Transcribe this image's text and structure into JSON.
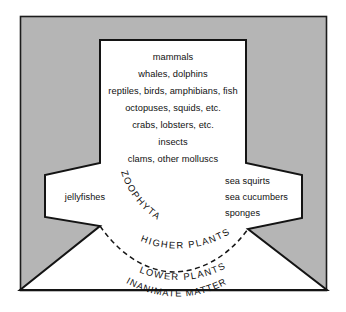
{
  "diagram": {
    "colors": {
      "background_gray": "#b5b5b5",
      "shape_fill": "#ffffff",
      "outline": "#141414",
      "text": "#111111"
    },
    "center_column": {
      "name": "animal-kingdom-list",
      "lines": [
        "mammals",
        "whales, dolphins",
        "reptiles, birds, amphibians, fish",
        "octopuses, squids, etc.",
        "crabs, lobsters, etc.",
        "insects",
        "clams, other molluscs"
      ]
    },
    "left_wing": {
      "name": "left-wing-group",
      "lines": [
        "jellyfishes"
      ]
    },
    "right_wing": {
      "name": "right-wing-group",
      "lines": [
        "sea squirts",
        "sea cucumbers",
        "sponges"
      ]
    },
    "arc_labels": [
      {
        "id": "zoophyta",
        "text": "ZOOPHYTA"
      },
      {
        "id": "higher-plants",
        "text": "HIGHER PLANTS"
      },
      {
        "id": "lower-plants",
        "text": "LOWER PLANTS"
      },
      {
        "id": "inanimate-matter",
        "text": "INANIMATE MATTER"
      }
    ]
  }
}
